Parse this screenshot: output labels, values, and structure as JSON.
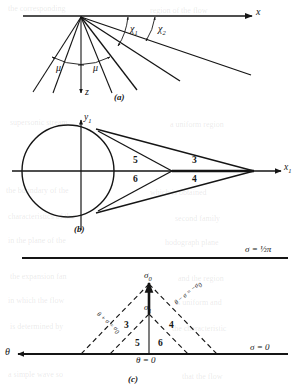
{
  "figure": {
    "captions": {
      "a": "(a)",
      "b": "(b)",
      "c": "(c)"
    },
    "colors": {
      "ink": "#151515",
      "paper": "#ffffff",
      "ghost": "rgba(120,120,120,0.17)"
    }
  },
  "panel_a": {
    "caption": "(a)",
    "axis_x_label": "x",
    "axis_z_label": "z",
    "angle_labels": {
      "mu_left": "μ",
      "mu_right": "μ"
    },
    "chi_labels": {
      "chi1": "χ",
      "chi1_sub": "1",
      "chi2": "χ",
      "chi2_sub": "2"
    }
  },
  "panel_b": {
    "caption": "(b)",
    "axis_x_label": "x",
    "axis_x_sub": "1",
    "axis_y_label": "y",
    "axis_y_sub": "1",
    "region_numbers": {
      "upper_left": "5",
      "upper_right": "3",
      "lower_left": "6",
      "lower_right": "4"
    }
  },
  "panel_c": {
    "caption": "(c)",
    "top_line_label": "σ = ½π",
    "bottom_line_label": "σ = 0",
    "theta_axis_label": "θ",
    "origin_label": "θ = 0",
    "sigma0_label": "σ",
    "sigma0_sub": "0",
    "sigma1_label": "σ",
    "sigma1_sub": "1",
    "left_char_label": "θ + σ = σ",
    "left_char_sub": "0",
    "right_char_label": "θ − σ = −σ",
    "right_char_sub": "0",
    "region_numbers": {
      "upper_left": "3",
      "upper_right": "4",
      "lower_left": "5",
      "lower_right": "6"
    }
  },
  "ghost_text": [
    {
      "t": "the corresponding",
      "x": 8,
      "y": 4
    },
    {
      "t": "region of the flow",
      "x": 150,
      "y": 6
    },
    {
      "t": "supersonic stream",
      "x": 10,
      "y": 118
    },
    {
      "t": "a uniform region",
      "x": 170,
      "y": 120
    },
    {
      "t": "the boundary of the",
      "x": 6,
      "y": 186
    },
    {
      "t": "which is obtained",
      "x": 150,
      "y": 188
    },
    {
      "t": "characteristics of the",
      "x": 8,
      "y": 212
    },
    {
      "t": "second family",
      "x": 175,
      "y": 214
    },
    {
      "t": "in the plane of the",
      "x": 8,
      "y": 236
    },
    {
      "t": "hodograph plane",
      "x": 165,
      "y": 238
    },
    {
      "t": "the expansion fan",
      "x": 10,
      "y": 272
    },
    {
      "t": "and the region",
      "x": 178,
      "y": 274
    },
    {
      "t": "in which the flow",
      "x": 8,
      "y": 296
    },
    {
      "t": "is uniform and",
      "x": 175,
      "y": 298
    },
    {
      "t": "is determined by",
      "x": 10,
      "y": 322
    },
    {
      "t": "the characteristic",
      "x": 172,
      "y": 324
    },
    {
      "t": "a simple wave so",
      "x": 8,
      "y": 370
    },
    {
      "t": "that the flow",
      "x": 182,
      "y": 372
    }
  ]
}
